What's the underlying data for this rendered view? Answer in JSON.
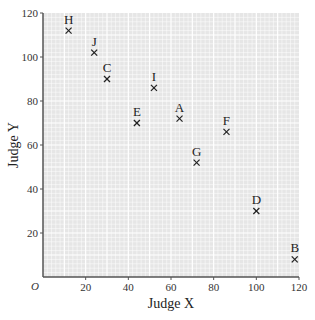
{
  "chart_data": {
    "type": "scatter",
    "title": "",
    "xlabel": "Judge X",
    "ylabel": "Judge Y",
    "xlim": [
      0,
      120
    ],
    "ylim": [
      0,
      120
    ],
    "x_ticks": [
      20,
      40,
      60,
      80,
      100,
      120
    ],
    "y_ticks": [
      20,
      40,
      60,
      80,
      100,
      120
    ],
    "origin_label": "O",
    "grid": true,
    "marker": "x",
    "points": [
      {
        "label": "A",
        "x": 64,
        "y": 72
      },
      {
        "label": "B",
        "x": 118,
        "y": 8
      },
      {
        "label": "C",
        "x": 30,
        "y": 90
      },
      {
        "label": "D",
        "x": 100,
        "y": 30
      },
      {
        "label": "E",
        "x": 44,
        "y": 70
      },
      {
        "label": "F",
        "x": 86,
        "y": 66
      },
      {
        "label": "G",
        "x": 72,
        "y": 52
      },
      {
        "label": "H",
        "x": 12,
        "y": 112
      },
      {
        "label": "I",
        "x": 52,
        "y": 86
      },
      {
        "label": "J",
        "x": 24,
        "y": 102
      }
    ]
  },
  "colors": {
    "grid_background": "#e6e6e6",
    "grid_line": "#ffffff",
    "axis": "#555555",
    "marker": "#222222"
  }
}
